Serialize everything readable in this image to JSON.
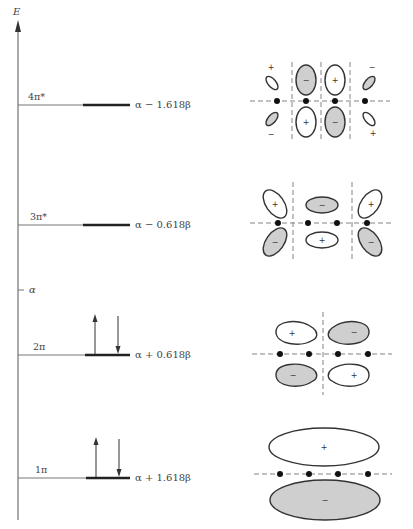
{
  "diagram": {
    "axis_label": "E",
    "alpha_label": "α",
    "levels": [
      {
        "name": "4π*",
        "energy": "α − 1.618β",
        "y": 105,
        "electrons": 0
      },
      {
        "name": "3π*",
        "energy": "α − 0.618β",
        "y": 225,
        "electrons": 0
      },
      {
        "name": "2π",
        "energy": "α + 0.618β",
        "y": 355,
        "electrons": 2
      },
      {
        "name": "1π",
        "energy": "α + 1.618β",
        "y": 478,
        "electrons": 2
      }
    ],
    "orbitals": [
      {
        "level": "4π*",
        "nodes": 3,
        "top_signs": [
          "+",
          "−",
          "+",
          "−"
        ],
        "bottom_signs": [
          "−",
          "+",
          "−",
          "+"
        ]
      },
      {
        "level": "3π*",
        "nodes": 2,
        "top_signs": [
          "+",
          "−",
          "−",
          "+"
        ],
        "bottom_signs": [
          "−",
          "+",
          "+",
          "−"
        ]
      },
      {
        "level": "2π",
        "nodes": 1,
        "top_signs": [
          "+",
          "+",
          "−",
          "−"
        ],
        "bottom_signs": [
          "−",
          "−",
          "+",
          "+"
        ]
      },
      {
        "level": "1π",
        "nodes": 0,
        "top_signs": [
          "+"
        ],
        "bottom_signs": [
          "−"
        ]
      }
    ],
    "signs": {
      "plus": "+",
      "minus": "−"
    }
  }
}
